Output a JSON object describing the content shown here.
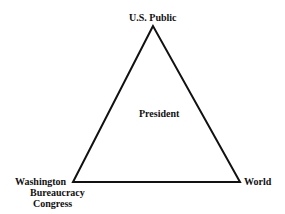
{
  "diagram": {
    "type": "triangle",
    "vertices": {
      "top": {
        "label": "U.S. Public"
      },
      "bottom_left": {
        "labels": [
          "Washington",
          "Bureaucracy",
          "Congress"
        ]
      },
      "bottom_right": {
        "label": "World"
      }
    },
    "center": {
      "label": "President"
    },
    "colors": {
      "line": "#111111",
      "background": "#ffffff"
    }
  }
}
